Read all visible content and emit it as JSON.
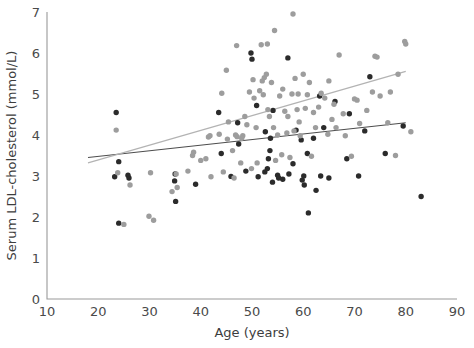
{
  "chart_data": {
    "type": "scatter",
    "title": "",
    "xlabel": "Age (years)",
    "ylabel": "Serum LDL-cholesterol (mmol/L)",
    "xlim": [
      10,
      90
    ],
    "ylim": [
      0,
      7
    ],
    "xticks": [
      10,
      20,
      30,
      40,
      50,
      60,
      70,
      80,
      90
    ],
    "yticks": [
      0,
      1,
      2,
      3,
      4,
      5,
      6,
      7
    ],
    "xtick_labels": [
      "10",
      "20",
      "30",
      "40",
      "50",
      "60",
      "70",
      "80",
      "90"
    ],
    "ytick_labels": [
      "0",
      "1",
      "2",
      "3",
      "4",
      "5",
      "6",
      "7"
    ],
    "grid": false,
    "legend": "none",
    "series": [
      {
        "name": "group-dark",
        "color": "#2b2b2b",
        "marker": "circle",
        "marker_size": 5.4,
        "points": [
          [
            23.5,
            4.55
          ],
          [
            24.0,
            3.35
          ],
          [
            23.2,
            2.98
          ],
          [
            24.0,
            1.85
          ],
          [
            26.0,
            2.95
          ],
          [
            25.8,
            3.02
          ],
          [
            34.9,
            2.88
          ],
          [
            35.0,
            3.05
          ],
          [
            35.1,
            2.38
          ],
          [
            39.0,
            2.8
          ],
          [
            43.5,
            4.55
          ],
          [
            44.0,
            3.55
          ],
          [
            45.9,
            2.99
          ],
          [
            47.2,
            4.3
          ],
          [
            47.4,
            3.78
          ],
          [
            48.8,
            3.12
          ],
          [
            49.8,
            6.0
          ],
          [
            50.0,
            5.85
          ],
          [
            50.9,
            4.72
          ],
          [
            51.2,
            2.98
          ],
          [
            52.5,
            3.1
          ],
          [
            52.6,
            4.08
          ],
          [
            53.0,
            3.18
          ],
          [
            53.2,
            3.42
          ],
          [
            53.5,
            3.62
          ],
          [
            53.6,
            3.92
          ],
          [
            54.0,
            2.85
          ],
          [
            54.1,
            4.6
          ],
          [
            55.0,
            3.02
          ],
          [
            55.2,
            2.95
          ],
          [
            56.0,
            2.92
          ],
          [
            57.0,
            5.88
          ],
          [
            57.2,
            3.05
          ],
          [
            58.0,
            3.3
          ],
          [
            58.6,
            4.12
          ],
          [
            59.6,
            3.88
          ],
          [
            59.8,
            2.9
          ],
          [
            60.1,
            3.0
          ],
          [
            60.2,
            2.78
          ],
          [
            60.8,
            3.55
          ],
          [
            61.0,
            2.1
          ],
          [
            62.0,
            3.92
          ],
          [
            62.5,
            2.65
          ],
          [
            63.2,
            4.95
          ],
          [
            63.4,
            3.0
          ],
          [
            64.0,
            4.18
          ],
          [
            65.0,
            2.95
          ],
          [
            66.2,
            4.82
          ],
          [
            68.5,
            3.42
          ],
          [
            69.0,
            4.52
          ],
          [
            70.8,
            3.0
          ],
          [
            72.0,
            4.1
          ],
          [
            73.0,
            5.42
          ],
          [
            76.0,
            3.55
          ],
          [
            79.5,
            4.22
          ],
          [
            83.0,
            2.5
          ]
        ]
      },
      {
        "name": "group-grey",
        "color": "#9d9d9d",
        "marker": "circle",
        "marker_size": 5.4,
        "points": [
          [
            23.5,
            4.12
          ],
          [
            23.8,
            3.08
          ],
          [
            25.0,
            1.82
          ],
          [
            26.2,
            2.78
          ],
          [
            29.9,
            2.02
          ],
          [
            30.8,
            1.92
          ],
          [
            30.2,
            3.08
          ],
          [
            34.4,
            2.62
          ],
          [
            35.2,
            3.05
          ],
          [
            35.4,
            2.72
          ],
          [
            37.5,
            3.12
          ],
          [
            38.4,
            3.5
          ],
          [
            38.6,
            3.58
          ],
          [
            40.0,
            3.38
          ],
          [
            41.0,
            3.42
          ],
          [
            41.5,
            3.95
          ],
          [
            41.8,
            3.98
          ],
          [
            42.0,
            2.98
          ],
          [
            43.6,
            4.02
          ],
          [
            44.1,
            5.02
          ],
          [
            44.4,
            3.1
          ],
          [
            45.0,
            5.58
          ],
          [
            45.4,
            4.32
          ],
          [
            46.2,
            3.62
          ],
          [
            46.5,
            2.95
          ],
          [
            47.0,
            6.18
          ],
          [
            47.1,
            3.96
          ],
          [
            47.8,
            3.32
          ],
          [
            48.2,
            3.98
          ],
          [
            48.6,
            4.45
          ],
          [
            49.0,
            4.25
          ],
          [
            49.5,
            5.05
          ],
          [
            49.9,
            3.18
          ],
          [
            50.2,
            5.35
          ],
          [
            50.4,
            4.9
          ],
          [
            50.8,
            4.18
          ],
          [
            51.0,
            3.32
          ],
          [
            51.5,
            5.08
          ],
          [
            51.8,
            6.2
          ],
          [
            52.0,
            5.32
          ],
          [
            52.2,
            4.98
          ],
          [
            52.4,
            5.4
          ],
          [
            52.8,
            5.48
          ],
          [
            53.0,
            6.22
          ],
          [
            53.1,
            4.62
          ],
          [
            53.4,
            4.45
          ],
          [
            53.8,
            5.28
          ],
          [
            54.2,
            4.18
          ],
          [
            54.4,
            6.55
          ],
          [
            54.6,
            3.38
          ],
          [
            55.0,
            4.0
          ],
          [
            55.4,
            4.95
          ],
          [
            55.8,
            3.52
          ],
          [
            56.0,
            5.12
          ],
          [
            56.4,
            4.58
          ],
          [
            56.8,
            4.05
          ],
          [
            57.0,
            4.45
          ],
          [
            57.4,
            3.45
          ],
          [
            57.8,
            5.0
          ],
          [
            58.0,
            6.95
          ],
          [
            58.2,
            4.1
          ],
          [
            58.4,
            5.38
          ],
          [
            58.8,
            4.62
          ],
          [
            59.0,
            5.0
          ],
          [
            59.2,
            4.32
          ],
          [
            59.4,
            3.98
          ],
          [
            60.0,
            5.48
          ],
          [
            60.4,
            4.65
          ],
          [
            60.8,
            4.98
          ],
          [
            61.2,
            5.28
          ],
          [
            61.6,
            3.48
          ],
          [
            62.0,
            4.55
          ],
          [
            62.4,
            4.18
          ],
          [
            63.0,
            4.68
          ],
          [
            63.5,
            5.02
          ],
          [
            64.2,
            4.9
          ],
          [
            64.8,
            4.02
          ],
          [
            65.0,
            5.32
          ],
          [
            65.6,
            4.38
          ],
          [
            66.0,
            4.75
          ],
          [
            66.4,
            4.18
          ],
          [
            67.0,
            5.95
          ],
          [
            67.8,
            4.52
          ],
          [
            68.2,
            3.98
          ],
          [
            69.4,
            3.48
          ],
          [
            70.0,
            4.88
          ],
          [
            70.5,
            4.85
          ],
          [
            71.0,
            4.28
          ],
          [
            72.4,
            4.6
          ],
          [
            73.5,
            5.05
          ],
          [
            74.0,
            5.92
          ],
          [
            74.4,
            5.9
          ],
          [
            75.0,
            4.95
          ],
          [
            76.5,
            4.3
          ],
          [
            77.0,
            5.05
          ],
          [
            78.0,
            3.5
          ],
          [
            78.5,
            5.48
          ],
          [
            79.8,
            6.28
          ],
          [
            80.0,
            6.22
          ],
          [
            81.0,
            4.08
          ],
          [
            48.0,
            3.92
          ],
          [
            46.8,
            4.0
          ],
          [
            45.2,
            3.9
          ]
        ]
      }
    ],
    "fit_lines": [
      {
        "name": "trend-dark",
        "color": "#4d4d4d",
        "width": 1.1,
        "x0": 18.0,
        "y0": 3.45,
        "x1": 80.0,
        "y1": 4.3
      },
      {
        "name": "trend-grey",
        "color": "#b3b3b3",
        "width": 1.2,
        "x0": 18.0,
        "y0": 3.32,
        "x1": 80.0,
        "y1": 5.55
      }
    ]
  },
  "geometry": {
    "plot_left": 47,
    "plot_right": 457,
    "plot_top": 12,
    "plot_bottom": 299,
    "width": 474,
    "height": 348
  }
}
